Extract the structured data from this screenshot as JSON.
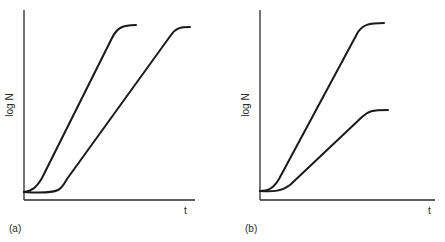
{
  "figure": {
    "panels": [
      {
        "id": "a",
        "label": "(a)",
        "y_axis_label": "log N",
        "x_axis_label": "t",
        "curves": [
          {
            "name": "curve-1",
            "description": "short lag, steep exponential rise, plateau high"
          },
          {
            "name": "curve-2",
            "description": "longer lag, same slope rise, plateau at same height"
          }
        ]
      },
      {
        "id": "b",
        "label": "(b)",
        "y_axis_label": "log N",
        "x_axis_label": "t",
        "curves": [
          {
            "name": "curve-1",
            "description": "short lag, steep rise, high plateau"
          },
          {
            "name": "curve-2",
            "description": "short lag, shallower rise, lower plateau"
          }
        ]
      }
    ],
    "colors": {
      "line": "#1a1a1a",
      "axis": "#2a2a2a",
      "background": "#ffffff"
    }
  }
}
